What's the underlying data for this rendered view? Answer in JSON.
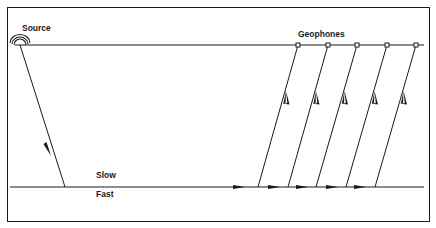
{
  "diagram": {
    "labels": {
      "source": "Source",
      "geophones": "Geophones",
      "slow": "Slow",
      "fast": "Fast"
    },
    "colors": {
      "ink": "#1a1a1a",
      "background": "#ffffff"
    },
    "geometry": {
      "surface_y": 45,
      "interface_y": 187,
      "source_x": 20,
      "incident_hit_x": 65,
      "geophone_x": [
        298,
        328,
        357,
        387,
        416
      ],
      "upgoing_start_x": [
        258,
        288,
        316,
        346,
        375
      ]
    }
  }
}
